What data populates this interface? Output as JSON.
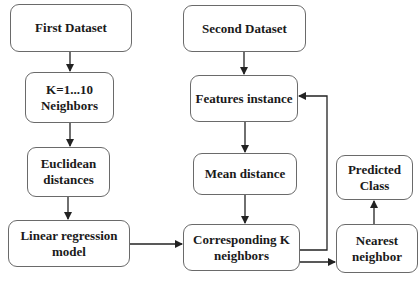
{
  "diagram": {
    "type": "flowchart",
    "colors": {
      "box_border": "#6a6a6a",
      "arrow": "#222222",
      "text": "#1a1a1a",
      "background": "#ffffff"
    },
    "nodes": {
      "first_dataset": {
        "label": "First Dataset"
      },
      "k_neighbors": {
        "label": "K=1...10 Neighbors"
      },
      "euclidean": {
        "label": "Euclidean distances"
      },
      "linear_regression": {
        "label": "Linear regression model"
      },
      "second_dataset": {
        "label": "Second Dataset"
      },
      "features_instance": {
        "label": "Features instance"
      },
      "mean_distance": {
        "label": "Mean distance"
      },
      "corresponding": {
        "label": "Corresponding K neighbors"
      },
      "predicted_class": {
        "label": "Predicted Class"
      },
      "nearest_neighbor": {
        "label": "Nearest neighbor"
      }
    },
    "edges": [
      {
        "from": "First Dataset",
        "to": "K=1...10 Neighbors"
      },
      {
        "from": "K=1...10 Neighbors",
        "to": "Euclidean distances"
      },
      {
        "from": "Euclidean distances",
        "to": "Linear regression model"
      },
      {
        "from": "Linear regression model",
        "to": "Corresponding K neighbors"
      },
      {
        "from": "Second Dataset",
        "to": "Features instance"
      },
      {
        "from": "Features instance",
        "to": "Mean distance"
      },
      {
        "from": "Mean distance",
        "to": "Corresponding K neighbors"
      },
      {
        "from": "Corresponding K neighbors",
        "to": "Features instance"
      },
      {
        "from": "Corresponding K neighbors",
        "to": "Nearest neighbor"
      },
      {
        "from": "Nearest neighbor",
        "to": "Predicted Class"
      }
    ]
  }
}
